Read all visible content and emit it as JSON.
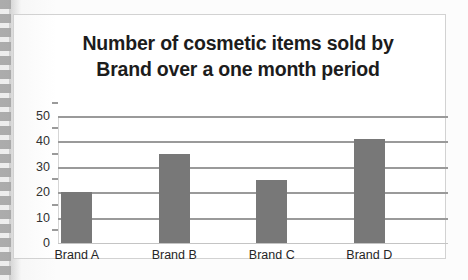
{
  "document": {
    "media": "scanned-worksheet-page",
    "binding_edge": "spiral-binding-left"
  },
  "chart_data": {
    "type": "bar",
    "title": "Number of cosmetic items sold by Brand over a one month period",
    "title_lines": [
      "Number of cosmetic items sold by",
      "Brand over a one month period"
    ],
    "categories": [
      "Brand A",
      "Brand B",
      "Brand C",
      "Brand D"
    ],
    "values": [
      20,
      35,
      25,
      41
    ],
    "xlabel": "",
    "ylabel": "",
    "ylim": [
      0,
      50
    ],
    "ytick_labels": [
      "50",
      "40",
      "30",
      "20",
      "10",
      "0"
    ],
    "ytick_values": [
      50,
      40,
      30,
      20,
      10,
      0
    ],
    "grid": true,
    "gridlines_horizontal": true,
    "legend": false,
    "legend_position": "none",
    "bar_color": "#787878",
    "gridline_color": "#9a9a9a",
    "plot_background": "#ffffff",
    "frame_border_color": "#d2d2d2",
    "title_color": "#1c1c1c",
    "label_color": "#262626"
  }
}
